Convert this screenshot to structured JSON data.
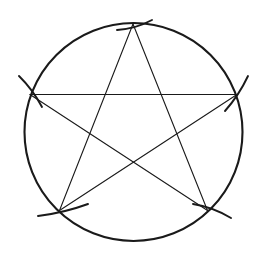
{
  "figure": {
    "title": "Pentagram inscribed in a circle",
    "background_color": "#ffffff",
    "ink_color": "#1a1a1a",
    "canvas": {
      "width": 266,
      "height": 255
    },
    "circle": {
      "name": "construction-circle",
      "center_x": 133.5,
      "center_y": 132,
      "radius": 109,
      "stroke_width": 2.1,
      "stroke_color": "#1a1a1a"
    },
    "vertices": [
      {
        "name": "vertex-top",
        "label": "A",
        "x": 133.0,
        "y": 24.0,
        "angle_deg": -90
      },
      {
        "name": "vertex-right",
        "label": "B",
        "x": 237.0,
        "y": 94.5,
        "angle_deg": -18
      },
      {
        "name": "vertex-bottom-right",
        "label": "C",
        "x": 207.5,
        "y": 210.5,
        "angle_deg": 54
      },
      {
        "name": "vertex-bottom-left",
        "label": "D",
        "x": 59.5,
        "y": 210.5,
        "angle_deg": 126
      },
      {
        "name": "vertex-left",
        "label": "E",
        "x": 30.0,
        "y": 94.5,
        "angle_deg": 198
      }
    ],
    "star": {
      "name": "pentagram-star",
      "stroke_width": 1.1,
      "stroke_color": "#1a1a1a",
      "edges": [
        {
          "name": "star-edge-A-C",
          "from": "vertex-top",
          "to": "vertex-bottom-right"
        },
        {
          "name": "star-edge-C-E",
          "from": "vertex-bottom-right",
          "to": "vertex-left"
        },
        {
          "name": "star-edge-E-B",
          "from": "vertex-left",
          "to": "vertex-right"
        },
        {
          "name": "star-edge-B-D",
          "from": "vertex-right",
          "to": "vertex-bottom-left"
        },
        {
          "name": "star-edge-D-A",
          "from": "vertex-bottom-left",
          "to": "vertex-top"
        }
      ]
    },
    "tick_marks": {
      "name": "compass-arc-ticks",
      "stroke_width": 1.9,
      "stroke_color": "#1a1a1a",
      "count": 5,
      "marks": [
        {
          "name": "tick-top",
          "x1": 117.0,
          "y1": 30.0,
          "x2": 152.0,
          "y2": 20.0,
          "bow": 4
        },
        {
          "name": "tick-right",
          "x1": 225.0,
          "y1": 111.0,
          "x2": 248.0,
          "y2": 76.0,
          "bow": 3
        },
        {
          "name": "tick-bottom-right",
          "x1": 193.0,
          "y1": 204.0,
          "x2": 231.0,
          "y2": 218.0,
          "bow": -4
        },
        {
          "name": "tick-bottom-left",
          "x1": 38.0,
          "y1": 216.0,
          "x2": 88.0,
          "y2": 204.0,
          "bow": 3
        },
        {
          "name": "tick-left",
          "x1": 19.0,
          "y1": 76.0,
          "x2": 42.0,
          "y2": 107.0,
          "bow": -3
        }
      ]
    }
  }
}
